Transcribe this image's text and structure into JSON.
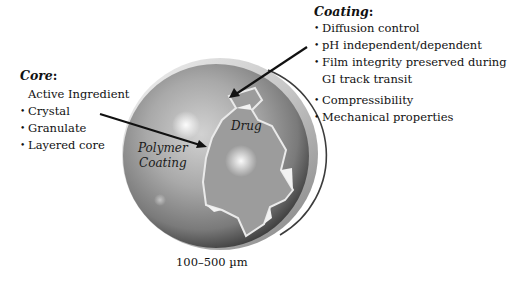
{
  "core": {
    "title": "Core",
    "colon": ":",
    "subtitle": "Active Ingredient",
    "items": [
      "Crystal",
      "Granulate",
      "Layered core"
    ]
  },
  "coating": {
    "title": "Coating",
    "colon": ":",
    "items": [
      "Diffusion control",
      "pH independent/dependent",
      "Film integrity preserved during",
      "GI track transit",
      "Compressibility",
      "Mechanical properties"
    ]
  },
  "sphere": {
    "drug_label": "Drug",
    "polymer_label_line1": "Polymer",
    "polymer_label_line2": "Coating",
    "size_label": "100–500 µm"
  },
  "colors": {
    "sphere_base": "#8c8c8c",
    "drug_region": "#9a9a9a",
    "text": "#111111",
    "arrow": "#111111"
  }
}
